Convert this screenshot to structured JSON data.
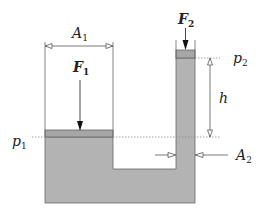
{
  "diagram": {
    "title": "",
    "type": "hydraulic press / communicating vessels",
    "labels": {
      "A1": {
        "main": "A",
        "sub": "1"
      },
      "F1": {
        "main": "F",
        "sub": "1"
      },
      "F2": {
        "main": "F",
        "sub": "2"
      },
      "p1": {
        "main": "p",
        "sub": "1"
      },
      "p2": {
        "main": "p",
        "sub": "2"
      },
      "h": {
        "main": "h"
      },
      "A2": {
        "main": "A",
        "sub": "2"
      }
    },
    "colors": {
      "liquid": "#b3b3b3",
      "piston": "#a6a6a6",
      "line": "#555555",
      "dotted": "#888888",
      "text": "#222222"
    }
  }
}
